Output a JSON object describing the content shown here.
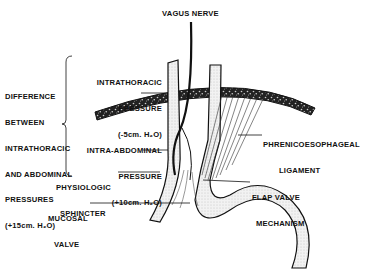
{
  "labels": {
    "vagus": "VAGUS NERVE",
    "difference": [
      "DIFFERENCE",
      "BETWEEN",
      "INTRATHORACIC",
      "AND ABDOMINAL",
      "PRESSURES",
      "(+15cm. H₂O)"
    ],
    "intrathoracic": [
      "INTRATHORACIC",
      "PRESSURE",
      "(-5cm. H₂O)"
    ],
    "intra_abdominal": [
      "INTRA-ABDOMINAL",
      "PRESSURE",
      "(+10cm. H₂O)"
    ],
    "phreno": [
      "PHRENICOESOPHAGEAL",
      "LIGAMENT"
    ],
    "sphincter": [
      "PHYSIOLOGIC",
      "SPHINCTER"
    ],
    "flap": [
      "FLAP VALVE",
      "MECHANISM"
    ],
    "mucosal": [
      "MUCOSAL",
      "VALVE"
    ]
  },
  "colors": {
    "ink": "#111111",
    "shade": "#d9d9d9",
    "background": "#ffffff"
  }
}
